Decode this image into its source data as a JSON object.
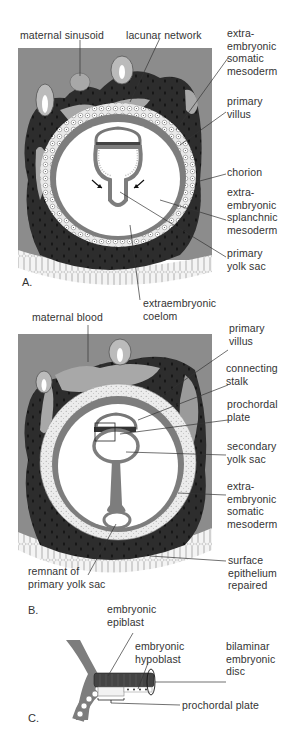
{
  "figure": {
    "panels": [
      {
        "id": "A",
        "letter": "A.",
        "labels": {
          "maternal_sinusoid": "maternal sinusoid",
          "lacunar_network": "lacunar network",
          "extraembryonic_somatic_mesoderm": "extra-\nembryonic\nsomatic\nmesoderm",
          "primary_villus": "primary\nvillus",
          "chorion": "chorion",
          "extraembryonic_splanchnic_mesoderm": "extra-\nembryonic\nsplanchnic\nmesoderm",
          "primary_yolk_sac": "primary\nyolk sac",
          "extraembryonic_coelom": "extraembryonic\ncoelom"
        }
      },
      {
        "id": "B",
        "letter": "B.",
        "labels": {
          "maternal_blood": "maternal blood",
          "primary_villus": "primary\nvillus",
          "connecting_stalk": "connecting\nstalk",
          "prochordal_plate": "prochordal\nplate",
          "secondary_yolk_sac": "secondary\nyolk sac",
          "extraembryonic_somatic_mesoderm": "extra-\nembryonic\nsomatic\nmesoderm",
          "remnant_primary_yolk_sac": "remnant of\nprimary yolk sac",
          "surface_epithelium_repaired": "surface\nepithelium\nrepaired"
        }
      },
      {
        "id": "C",
        "letter": "C.",
        "labels": {
          "embryonic_epiblast": "embryonic\nepiblast",
          "embryonic_hypoblast": "embryonic\nhypoblast",
          "bilaminar_embryonic_disc": "bilaminar\nembryonic\ndisc",
          "prochordal_plate": "prochordal plate"
        }
      }
    ],
    "colors": {
      "endometrium": "#8a8a8a",
      "syncytiotrophoblast": "#2b2b2b",
      "blood": "#a6a6a6",
      "cytotrophoblast": "#e8e8e8",
      "mesoderm": "#7a7a7a",
      "cavity": "#ffffff",
      "epithelium": "#f2f2f2"
    }
  }
}
